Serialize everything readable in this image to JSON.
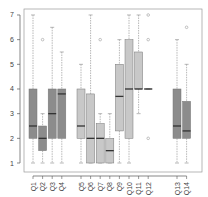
{
  "chart_data": {
    "type": "boxplot",
    "title": "",
    "xlabel": "",
    "ylabel": "",
    "ylim": [
      1,
      7
    ],
    "yticks": [
      1,
      2,
      3,
      4,
      5,
      6,
      7
    ],
    "grid": false,
    "categories": [
      "Q1",
      "Q2",
      "Q3",
      "Q4",
      "Q5",
      "Q6",
      "Q7",
      "Q8",
      "Q9",
      "Q10",
      "Q11",
      "Q12",
      "Q13",
      "Q14"
    ],
    "boxes": [
      {
        "label": "Q1",
        "min": 1,
        "q1": 2,
        "median": 2.5,
        "q3": 4,
        "max": 7,
        "outliers": [],
        "color": "#8c8c8c"
      },
      {
        "label": "Q2",
        "min": 1,
        "q1": 1.5,
        "median": 2,
        "q3": 2.5,
        "max": 3,
        "outliers": [
          6
        ],
        "color": "#8c8c8c"
      },
      {
        "label": "Q3",
        "min": 1,
        "q1": 2,
        "median": 3,
        "q3": 4,
        "max": 6.5,
        "outliers": [],
        "color": "#8c8c8c"
      },
      {
        "label": "Q4",
        "min": 1,
        "q1": 2,
        "median": 3.8,
        "q3": 4,
        "max": 5.5,
        "outliers": [],
        "color": "#8c8c8c"
      },
      {
        "label": "Q5",
        "min": 1,
        "q1": 2,
        "median": 2.5,
        "q3": 4,
        "max": 5,
        "outliers": [],
        "color": "#c8c8c8"
      },
      {
        "label": "Q6",
        "min": 1,
        "q1": 1,
        "median": 2,
        "q3": 3.8,
        "max": 7,
        "outliers": [],
        "color": "#c8c8c8"
      },
      {
        "label": "Q7",
        "min": 1,
        "q1": 1,
        "median": 2,
        "q3": 2.6,
        "max": 3,
        "outliers": [
          6
        ],
        "color": "#c8c8c8"
      },
      {
        "label": "Q8",
        "min": 1,
        "q1": 1,
        "median": 1.5,
        "q3": 2,
        "max": 3,
        "outliers": [],
        "color": "#c8c8c8"
      },
      {
        "label": "Q9",
        "min": 1,
        "q1": 2.3,
        "median": 3.7,
        "q3": 5,
        "max": 6,
        "outliers": [],
        "color": "#c8c8c8"
      },
      {
        "label": "Q10",
        "min": 1,
        "q1": 2,
        "median": 4,
        "q3": 6,
        "max": 7,
        "outliers": [],
        "color": "#c8c8c8"
      },
      {
        "label": "Q11",
        "min": 3,
        "q1": 4,
        "median": 4,
        "q3": 5.5,
        "max": 7,
        "outliers": [],
        "color": "#c8c8c8"
      },
      {
        "label": "Q12",
        "min": 4,
        "q1": 4,
        "median": 4,
        "q3": 4,
        "max": 4,
        "outliers": [
          7,
          6,
          2
        ],
        "color": "#c8c8c8"
      },
      {
        "label": "Q13",
        "min": 1,
        "q1": 2,
        "median": 2.5,
        "q3": 4,
        "max": 6,
        "outliers": [],
        "color": "#8c8c8c"
      },
      {
        "label": "Q14",
        "min": 1,
        "q1": 2,
        "median": 2.3,
        "q3": 3.5,
        "max": 5,
        "outliers": [
          6.5
        ],
        "color": "#8c8c8c"
      }
    ],
    "positions": [
      1,
      2,
      3,
      4,
      6,
      7,
      8,
      9,
      10,
      11,
      12,
      13,
      16,
      17
    ],
    "colors": {
      "dark_group": "#8c8c8c",
      "light_group": "#c8c8c8",
      "median": "#333333",
      "whisker": "#888888",
      "axis": "#555555",
      "frame": "#999999"
    }
  }
}
